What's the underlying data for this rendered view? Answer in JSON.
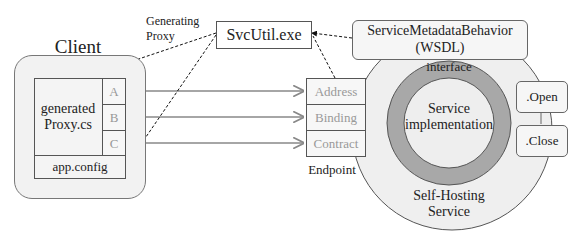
{
  "client": {
    "title": "Client",
    "proxy_label_1": "generated",
    "proxy_label_2": "Proxy.cs",
    "slots": [
      "A",
      "B",
      "C"
    ],
    "config": "app.config"
  },
  "generator": {
    "label_1": "Generating",
    "label_2": "Proxy",
    "tool": "SvcUtil.exe"
  },
  "endpoint": {
    "title": "Endpoint",
    "parts": [
      "Address",
      "Binding",
      "Contract"
    ]
  },
  "service": {
    "metadata_1": "ServiceMetadataBehavior",
    "metadata_2": "(WSDL)",
    "interface": "interface",
    "impl_1": "Service",
    "impl_2": "implementation",
    "host_1": "Self-Hosting",
    "host_2": "Service",
    "buttons": [
      ".Open",
      ".Close"
    ]
  },
  "colors": {
    "host_fill": "#efefef",
    "ring": "#a8a8a8",
    "core": "#eeeeee",
    "line": "#888888"
  }
}
